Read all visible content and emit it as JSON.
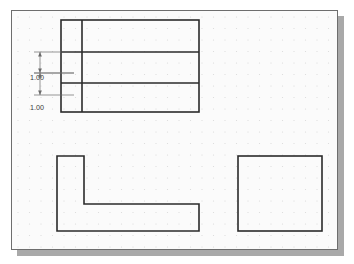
{
  "app": {
    "title": "CAD Drawing Canvas",
    "canvas_background": "#fbfbfb",
    "sheet_border_color": "#6e6e6e",
    "shadow_color": "#a9a9a9",
    "geometry_color": "#2b2b2b",
    "grid_dot_color": "#d9d9d9",
    "dimension_color": "#6a6a6a",
    "dimension_text_color": "#3a3a3a"
  },
  "grid": {
    "spacing_px": 11.5,
    "origin_x": 6,
    "origin_y": 6,
    "dot_radius": 0.6
  },
  "dimensions": [
    {
      "name": "upper-vertical-dimension",
      "label": "1.00",
      "label_x": 18,
      "label_y": 69,
      "line_x": 28,
      "y_start": 41,
      "y_end": 62,
      "ext_start_x": 28,
      "ext_end_x": 62
    },
    {
      "name": "lower-vertical-dimension",
      "label": "1.00",
      "label_x": 18,
      "label_y": 99,
      "line_x": 28,
      "y_start": 62,
      "y_end": 84,
      "ext_start_x": 28,
      "ext_end_x": 62
    }
  ],
  "shapes": [
    {
      "name": "top-view-rectangle",
      "type": "rect",
      "x": 49,
      "y": 9,
      "width": 138,
      "height": 92
    },
    {
      "name": "top-view-vertical-divider",
      "type": "line",
      "x1": 70,
      "y1": 9,
      "x2": 70,
      "y2": 101
    },
    {
      "name": "top-view-horizontal-divider-upper",
      "type": "line",
      "x1": 49,
      "y1": 41,
      "x2": 187,
      "y2": 41
    },
    {
      "name": "top-view-horizontal-divider-lower",
      "type": "line",
      "x1": 49,
      "y1": 72,
      "x2": 187,
      "y2": 72
    },
    {
      "name": "front-view-l-shape",
      "type": "polygon",
      "points": "45,145 72,145 72,193 187,193 187,220 45,220"
    },
    {
      "name": "side-view-rectangle",
      "type": "rect",
      "x": 226,
      "y": 145,
      "width": 84,
      "height": 75
    }
  ]
}
